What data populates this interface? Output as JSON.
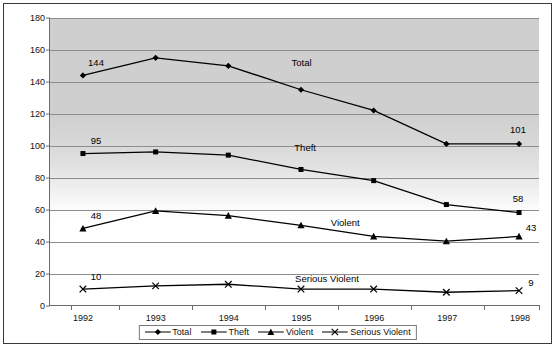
{
  "chart_data": {
    "type": "line",
    "title": "",
    "xlabel": "",
    "ylabel": "",
    "categories": [
      "1992",
      "1993",
      "1994",
      "1995",
      "1996",
      "1997",
      "1998"
    ],
    "x": [
      1992,
      1993,
      1994,
      1995,
      1996,
      1997,
      1998
    ],
    "ylim": [
      0,
      180
    ],
    "ytick_step": 20,
    "yticks": [
      "0",
      "20",
      "40",
      "60",
      "80",
      "100",
      "120",
      "140",
      "160",
      "180"
    ],
    "grid": true,
    "legend_position": "bottom-center",
    "series": [
      {
        "name": "Total",
        "marker": "diamond",
        "values": [
          144,
          155,
          150,
          135,
          122,
          101,
          101
        ],
        "endpoint_labels": {
          "first": "144",
          "last": "101"
        },
        "inline_label": "Total"
      },
      {
        "name": "Theft",
        "marker": "square",
        "values": [
          95,
          96,
          94,
          85,
          78,
          63,
          58
        ],
        "endpoint_labels": {
          "first": "95",
          "last": "58"
        },
        "inline_label": "Theft"
      },
      {
        "name": "Violent",
        "marker": "triangle",
        "values": [
          48,
          59,
          56,
          50,
          43,
          40,
          43
        ],
        "endpoint_labels": {
          "first": "48",
          "last": "43"
        },
        "inline_label": "Violent"
      },
      {
        "name": "Serious Violent",
        "marker": "cross",
        "values": [
          10,
          12,
          13,
          10,
          10,
          8,
          9
        ],
        "endpoint_labels": {
          "first": "10",
          "last": "9"
        },
        "inline_label": "Serious Violent"
      }
    ],
    "legend": [
      {
        "label": "Total",
        "marker": "diamond"
      },
      {
        "label": "Theft",
        "marker": "square"
      },
      {
        "label": "Violent",
        "marker": "triangle"
      },
      {
        "label": "Serious Violent",
        "marker": "cross"
      }
    ],
    "colors": {
      "line": "#000000",
      "marker": "#000000",
      "grid": "#8d8d8d",
      "axis": "#6b6b6b",
      "plot_bg_top": "#cfcfcf",
      "plot_bg_bottom": "#ffffff",
      "frame": "#3a3a3a"
    },
    "inline_label_positions": {
      "Total": {
        "year": 1995.0,
        "value": 152
      },
      "Theft": {
        "year": 1995.05,
        "value": 99
      },
      "Violent": {
        "year": 1995.6,
        "value": 52
      },
      "Serious Violent": {
        "year": 1995.35,
        "value": 17
      }
    }
  }
}
